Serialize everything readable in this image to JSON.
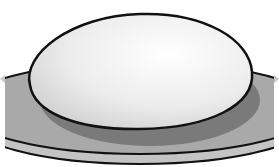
{
  "illustration": {
    "subject": "dome-on-plate",
    "colors": {
      "background": "#ffffff",
      "plate": "#a9a9a9",
      "plate_rim": "#c4c4c4",
      "shadow": "#7a7a7a",
      "dome_highlight": "#ffffff",
      "dome_edge": "#d6d6d6",
      "outline": "#111111",
      "side_arrow": "#c8c8c8"
    }
  }
}
